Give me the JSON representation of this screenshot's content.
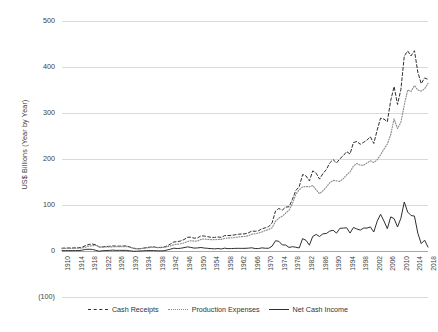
{
  "chart_data": {
    "type": "line",
    "title": "",
    "xlabel": "",
    "ylabel": "US$ Billions (Year by Year)",
    "xlim": [
      1910,
      2018
    ],
    "ylim": [
      -100,
      500
    ],
    "ytick_labels": [
      "500",
      "400",
      "300",
      "200",
      "100",
      "0",
      "(100)"
    ],
    "ytick_values": [
      500,
      400,
      300,
      200,
      100,
      0,
      -100
    ],
    "xtick_labels": [
      "1910",
      "1914",
      "1918",
      "1922",
      "1926",
      "1930",
      "1934",
      "1938",
      "1942",
      "1946",
      "1950",
      "1954",
      "1958",
      "1962",
      "1966",
      "1970",
      "1974",
      "1978",
      "1982",
      "1986",
      "1990",
      "1994",
      "1998",
      "2002",
      "2006",
      "2010",
      "2014",
      "2018"
    ],
    "grid": true,
    "legend_position": "bottom",
    "x": [
      1910,
      1911,
      1912,
      1913,
      1914,
      1915,
      1916,
      1917,
      1918,
      1919,
      1920,
      1921,
      1922,
      1923,
      1924,
      1925,
      1926,
      1927,
      1928,
      1929,
      1930,
      1931,
      1932,
      1933,
      1934,
      1935,
      1936,
      1937,
      1938,
      1939,
      1940,
      1941,
      1942,
      1943,
      1944,
      1945,
      1946,
      1947,
      1948,
      1949,
      1950,
      1951,
      1952,
      1953,
      1954,
      1955,
      1956,
      1957,
      1958,
      1959,
      1960,
      1961,
      1962,
      1963,
      1964,
      1965,
      1966,
      1967,
      1968,
      1969,
      1970,
      1971,
      1972,
      1973,
      1974,
      1975,
      1976,
      1977,
      1978,
      1979,
      1980,
      1981,
      1982,
      1983,
      1984,
      1985,
      1986,
      1987,
      1988,
      1989,
      1990,
      1991,
      1992,
      1993,
      1994,
      1995,
      1996,
      1997,
      1998,
      1999,
      2000,
      2001,
      2002,
      2003,
      2004,
      2005,
      2006,
      2007,
      2008,
      2009,
      2010,
      2011,
      2012,
      2013,
      2014,
      2015,
      2016,
      2017,
      2018
    ],
    "series": [
      {
        "name": "Cash Receipts",
        "style": "dashed",
        "color": "#2f2f2f",
        "values": [
          6.1,
          6.3,
          6.6,
          6.5,
          6.9,
          7.1,
          8.5,
          11.9,
          14.5,
          15.1,
          13.3,
          8.5,
          9.1,
          9.7,
          10.2,
          11.0,
          10.6,
          10.6,
          10.8,
          11.0,
          8.8,
          6.0,
          4.6,
          5.1,
          6.2,
          7.6,
          8.4,
          9.0,
          7.7,
          7.8,
          8.4,
          11.1,
          15.2,
          19.6,
          20.3,
          21.7,
          24.8,
          29.6,
          30.2,
          27.8,
          28.5,
          32.9,
          32.5,
          31.0,
          29.8,
          29.5,
          30.4,
          29.7,
          33.4,
          33.6,
          34.0,
          35.1,
          36.4,
          37.0,
          37.3,
          39.4,
          43.4,
          42.8,
          44.2,
          48.2,
          50.5,
          52.9,
          61.1,
          86.9,
          92.4,
          88.9,
          95.4,
          96.2,
          112.4,
          131.5,
          139.7,
          166.3,
          163.3,
          152.3,
          174.2,
          169.2,
          156.3,
          168.4,
          177.0,
          191.4,
          198.6,
          191.3,
          200.5,
          207.2,
          216.1,
          210.8,
          235.8,
          238.1,
          232.1,
          236.3,
          241.2,
          248.4,
          233.7,
          262.8,
          288.8,
          286.8,
          280.9,
          327.4,
          357.5,
          318.5,
          351.1,
          423.9,
          434.8,
          424.1,
          435.4,
          388.6,
          363.7,
          376.2,
          373.0
        ]
      },
      {
        "name": "Production Expenses",
        "style": "dotted",
        "color": "#8d8d8d",
        "values": [
          5.3,
          5.5,
          5.7,
          5.7,
          6.0,
          6.1,
          6.7,
          8.4,
          10.7,
          11.7,
          11.9,
          9.0,
          8.3,
          8.8,
          8.9,
          9.2,
          9.3,
          9.2,
          9.4,
          9.6,
          8.4,
          6.5,
          5.1,
          5.0,
          5.8,
          6.7,
          7.5,
          8.0,
          7.3,
          7.4,
          7.8,
          9.0,
          11.2,
          13.5,
          14.9,
          15.8,
          17.5,
          20.6,
          22.4,
          21.5,
          21.8,
          25.3,
          26.1,
          25.2,
          24.6,
          24.8,
          25.0,
          25.3,
          27.2,
          28.5,
          28.7,
          29.4,
          30.6,
          31.3,
          31.5,
          33.2,
          36.4,
          37.5,
          38.9,
          41.4,
          44.5,
          46.9,
          50.5,
          64.6,
          71.4,
          75.7,
          82.4,
          88.5,
          103.0,
          123.3,
          133.1,
          139.4,
          140.1,
          139.6,
          142.3,
          133.2,
          124.8,
          131.0,
          139.0,
          148.2,
          153.5,
          152.5,
          151.2,
          157.4,
          165.6,
          171.8,
          184.7,
          190.2,
          186.6,
          186.4,
          191.4,
          196.1,
          192.4,
          198.2,
          209.0,
          221.6,
          232.4,
          253.2,
          287.2,
          266.3,
          279.9,
          317.4,
          350.1,
          347.0,
          359.5,
          350.0,
          347.6,
          352.6,
          364.5
        ]
      },
      {
        "name": "Net Cash Income",
        "style": "solid",
        "color": "#2f2f2f",
        "values": [
          0.8,
          0.8,
          0.9,
          0.8,
          0.9,
          1.0,
          1.8,
          3.5,
          3.8,
          3.4,
          1.4,
          -0.5,
          0.8,
          0.9,
          1.3,
          1.8,
          1.3,
          1.4,
          1.4,
          1.4,
          0.4,
          -0.5,
          -0.5,
          0.1,
          0.4,
          0.9,
          0.9,
          1.0,
          0.4,
          0.4,
          0.6,
          2.1,
          4.0,
          6.1,
          5.4,
          5.9,
          7.3,
          9.0,
          7.8,
          6.3,
          6.7,
          7.6,
          6.4,
          5.8,
          5.2,
          4.7,
          5.4,
          4.4,
          6.2,
          5.1,
          5.3,
          5.7,
          5.8,
          5.7,
          5.8,
          6.2,
          7.0,
          5.3,
          5.3,
          6.8,
          6.0,
          6.0,
          10.6,
          22.3,
          21.0,
          13.2,
          13.0,
          7.7,
          9.4,
          8.2,
          6.6,
          26.9,
          23.2,
          12.7,
          31.9,
          36.0,
          31.5,
          37.4,
          38.0,
          43.2,
          45.1,
          38.8,
          49.3,
          49.8,
          50.5,
          39.0,
          51.1,
          47.9,
          45.5,
          49.9,
          49.8,
          52.3,
          41.3,
          64.6,
          79.8,
          65.2,
          48.5,
          74.2,
          70.3,
          52.2,
          71.2,
          106.5,
          84.7,
          77.1,
          75.9,
          38.6,
          16.1,
          23.6,
          8.5
        ]
      }
    ]
  },
  "legend": {
    "items": [
      {
        "label": "Cash Receipts"
      },
      {
        "label": "Production Expenses"
      },
      {
        "label": "Net Cash Income"
      }
    ]
  }
}
